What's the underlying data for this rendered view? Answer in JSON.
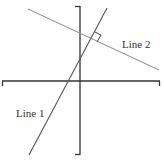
{
  "diagram": {
    "type": "coordinate-axes-with-perpendicular-lines",
    "colors": {
      "axis": "#333333",
      "line1": "#555555",
      "line2": "#9a9a9a",
      "label": "#333333",
      "background": "#ffffff"
    },
    "axes": {
      "horizontal": {
        "x1": 2,
        "x2": 160,
        "y": 81
      },
      "vertical": {
        "x": 80,
        "y1": 6,
        "y2": 155
      }
    },
    "lines": [
      {
        "id": "line1",
        "label": "Line 1",
        "x1": 107,
        "y1": 8,
        "x2": 29,
        "y2": 155,
        "label_x": 16,
        "label_y": 117
      },
      {
        "id": "line2",
        "label": "Line 2",
        "x1": 28,
        "y1": 9,
        "x2": 159,
        "y2": 70,
        "label_x": 122,
        "label_y": 48
      }
    ],
    "right_angle_marker": {
      "points": "95,32 101,35 97,42"
    }
  }
}
